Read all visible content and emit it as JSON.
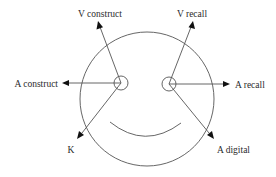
{
  "diagram": {
    "type": "face-with-eye-accessing-cues",
    "labels": {
      "v_construct": "V construct",
      "v_recall": "V recall",
      "a_construct": "A construct",
      "a_recall": "A recall",
      "k": "K",
      "a_digital": "A digital"
    },
    "colors": {
      "line": "#555555",
      "arrowhead": "#111111",
      "text": "#2b2b2b",
      "background": "#ffffff"
    }
  }
}
